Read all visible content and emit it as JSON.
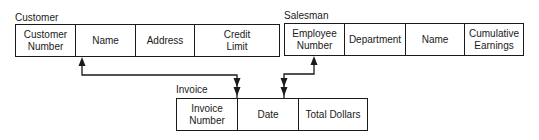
{
  "tables": {
    "customer": {
      "title": "Customer",
      "fields": [
        "Customer\nNumber",
        "Name",
        "Address",
        "Credit\nLimit"
      ]
    },
    "salesman": {
      "title": "Salesman",
      "fields": [
        "Employee\nNumber",
        "Department",
        "Name",
        "Cumulative\nEarnings"
      ]
    },
    "invoice": {
      "title": "Invoice",
      "fields": [
        "Invoice\nNumber",
        "Date",
        "Total Dollars"
      ]
    }
  },
  "relationships": [
    {
      "from": "customer.Customer Number",
      "to": "invoice.Invoice Number",
      "type": "one-to-many"
    },
    {
      "from": "salesman.Employee Number",
      "to": "invoice.Date",
      "type": "one-to-many"
    }
  ],
  "colors": {
    "line": "#1a1a1a",
    "background": "#ffffff"
  }
}
